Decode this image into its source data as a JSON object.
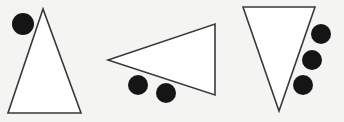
{
  "figure": {
    "background": "#f4f4f2",
    "stroke_color": "#3a3a3a",
    "dot_color": "#151515",
    "panels": [
      {
        "name": "triangle-up",
        "triangle": [
          [
            43,
            9
          ],
          [
            8,
            113
          ],
          [
            81,
            113
          ]
        ],
        "dots": [
          {
            "cx": 23,
            "cy": 24,
            "r": 11
          }
        ]
      },
      {
        "name": "triangle-left",
        "triangle": [
          [
            108,
            60
          ],
          [
            215,
            24
          ],
          [
            215,
            95
          ]
        ],
        "dots": [
          {
            "cx": 138,
            "cy": 85,
            "r": 10
          },
          {
            "cx": 166,
            "cy": 93,
            "r": 10
          }
        ]
      },
      {
        "name": "triangle-down",
        "triangle": [
          [
            243,
            7
          ],
          [
            315,
            7
          ],
          [
            279,
            111
          ]
        ],
        "dots": [
          {
            "cx": 321,
            "cy": 34,
            "r": 10
          },
          {
            "cx": 312,
            "cy": 60,
            "r": 10
          },
          {
            "cx": 303,
            "cy": 85,
            "r": 10
          }
        ]
      }
    ]
  }
}
